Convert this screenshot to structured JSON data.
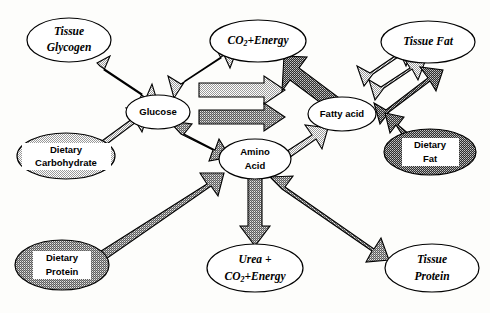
{
  "diagram": {
    "background_color": "#fdfdfb",
    "outline_color": "#000000",
    "fills": {
      "white": "#ffffff",
      "light_stipple": "#d8d8d8",
      "medium_stipple": "#b0b0b0",
      "dark_stipple": "#4a4a4a"
    },
    "nodes": [
      {
        "id": "tissue-glycogen",
        "label_lines": [
          "Tissue",
          "Glycogen"
        ],
        "style": "italic-serif",
        "fill": "white",
        "cx": 69,
        "cy": 40,
        "rx": 42,
        "ry": 22
      },
      {
        "id": "co2-energy-top",
        "label_lines": [
          "CO2+Energy"
        ],
        "style": "italic-serif",
        "fill": "white",
        "cx": 258,
        "cy": 41,
        "rx": 48,
        "ry": 21
      },
      {
        "id": "tissue-fat",
        "label_lines": [
          "Tissue Fat"
        ],
        "style": "italic-serif",
        "fill": "white",
        "cx": 428,
        "cy": 42,
        "rx": 47,
        "ry": 21
      },
      {
        "id": "glucose",
        "label_lines": [
          "Glucose"
        ],
        "style": "bold-sans",
        "fill": "white",
        "cx": 158,
        "cy": 112,
        "rx": 32,
        "ry": 17
      },
      {
        "id": "fatty-acid",
        "label_lines": [
          "Fatty acid"
        ],
        "style": "bold-sans",
        "fill": "white",
        "cx": 342,
        "cy": 114,
        "rx": 34,
        "ry": 17
      },
      {
        "id": "dietary-carbohydrate",
        "label_lines": [
          "Dietary",
          "Carbohydrate"
        ],
        "style": "bold-sans",
        "fill": "light_stipple",
        "cx": 66,
        "cy": 156,
        "rx": 49,
        "ry": 23
      },
      {
        "id": "amino-acid",
        "label_lines": [
          "Amino",
          "Acid"
        ],
        "style": "bold-sans",
        "fill": "white",
        "cx": 255,
        "cy": 159,
        "rx": 36,
        "ry": 20
      },
      {
        "id": "dietary-fat",
        "label_lines": [
          "Dietary",
          "Fat"
        ],
        "style": "bold-sans",
        "fill": "dark_stipple",
        "cx": 430,
        "cy": 152,
        "rx": 46,
        "ry": 23
      },
      {
        "id": "dietary-protein",
        "label_lines": [
          "Dietary",
          "Protein"
        ],
        "style": "bold-sans",
        "fill": "medium_stipple",
        "cx": 62,
        "cy": 265,
        "rx": 47,
        "ry": 25
      },
      {
        "id": "urea-co2-energy",
        "label_lines": [
          "Urea +",
          "CO2+Energy"
        ],
        "style": "italic-serif",
        "fill": "white",
        "cx": 255,
        "cy": 268,
        "rx": 48,
        "ry": 24
      },
      {
        "id": "tissue-protein",
        "label_lines": [
          "Tissue",
          "Protein"
        ],
        "style": "italic-serif",
        "fill": "white",
        "cx": 432,
        "cy": 268,
        "rx": 47,
        "ry": 24
      }
    ],
    "arrows": [
      {
        "id": "glucose-tissue-glycogen",
        "from": "glucose",
        "to": "tissue-glycogen",
        "heads": "double",
        "shade": "light_stipple"
      },
      {
        "id": "glucose-co2-energy",
        "from": "glucose",
        "to": "co2-energy-top",
        "heads": "double",
        "shade": "light_stipple"
      },
      {
        "id": "dietary-carbohydrate-glucose",
        "from": "dietary-carbohydrate",
        "to": "glucose",
        "heads": "single",
        "shade": "light_stipple"
      },
      {
        "id": "glucose-amino-acid",
        "from": "glucose",
        "to": "amino-acid",
        "heads": "double",
        "shade": "medium_stipple"
      },
      {
        "id": "glucose-fatty-acid-upper",
        "from": "glucose",
        "to": "fatty-acid",
        "heads": "single",
        "shade": "light_stipple"
      },
      {
        "id": "glucose-fatty-acid-lower",
        "from": "glucose",
        "to": "fatty-acid",
        "heads": "single",
        "shade": "medium_stipple"
      },
      {
        "id": "fatty-acid-co2-energy",
        "from": "fatty-acid",
        "to": "co2-energy-top",
        "heads": "single",
        "shade": "dark_stipple"
      },
      {
        "id": "fatty-acid-tissue-fat-1",
        "from": "fatty-acid",
        "to": "tissue-fat",
        "heads": "double",
        "shade": "light_stipple"
      },
      {
        "id": "fatty-acid-tissue-fat-2",
        "from": "fatty-acid",
        "to": "tissue-fat",
        "heads": "double",
        "shade": "light_stipple"
      },
      {
        "id": "fatty-acid-tissue-fat-3",
        "from": "fatty-acid",
        "to": "tissue-fat",
        "heads": "double",
        "shade": "dark_stipple"
      },
      {
        "id": "dietary-fat-fatty-acid",
        "from": "dietary-fat",
        "to": "fatty-acid",
        "heads": "single",
        "shade": "dark_stipple"
      },
      {
        "id": "amino-acid-fatty-acid",
        "from": "amino-acid",
        "to": "fatty-acid",
        "heads": "single",
        "shade": "light_stipple"
      },
      {
        "id": "amino-acid-urea",
        "from": "amino-acid",
        "to": "urea-co2-energy",
        "heads": "single",
        "shade": "medium_stipple"
      },
      {
        "id": "dietary-protein-amino-acid",
        "from": "dietary-protein",
        "to": "amino-acid",
        "heads": "single",
        "shade": "medium_stipple"
      },
      {
        "id": "amino-acid-tissue-protein",
        "from": "amino-acid",
        "to": "tissue-protein",
        "heads": "double",
        "shade": "medium_stipple"
      }
    ]
  }
}
